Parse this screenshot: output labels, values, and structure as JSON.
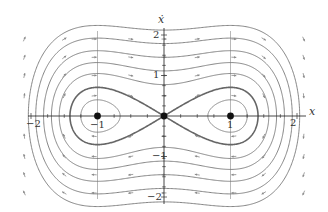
{
  "figure": {
    "type": "phase-portrait",
    "system": "x'' = x - x^3",
    "axes": {
      "x_label": "x",
      "y_label": "ẋ",
      "x_ticks": [
        "-2",
        "-1",
        "1",
        "2"
      ],
      "y_ticks": [
        "2",
        "1",
        "-1",
        "-2"
      ],
      "xlim": [
        -2.3,
        2.3
      ],
      "ylim": [
        -2.1,
        2.1
      ]
    },
    "equilibria": [
      {
        "x": -1,
        "y": 0,
        "kind": "center"
      },
      {
        "x": 0,
        "y": 0,
        "kind": "saddle"
      },
      {
        "x": 1,
        "y": 0,
        "kind": "center"
      }
    ],
    "energy_levels": [
      -0.17,
      0.0,
      0.3,
      0.62,
      1.05,
      1.6,
      2.25
    ],
    "separatrix_level": 0.0,
    "colors": {
      "curve": "#777777",
      "separatrix": "#666666",
      "axis": "#333333",
      "grid": "#999999",
      "arrow": "#888888",
      "point": "#111111"
    }
  },
  "labels": {
    "x_axis": "x",
    "y_axis": "ẋ",
    "xt_m2": "−2",
    "xt_m1": "−1",
    "xt_1": "1",
    "xt_2": "2",
    "yt_2": "2",
    "yt_1": "1",
    "yt_m1": "−1",
    "yt_m2": "−2"
  }
}
